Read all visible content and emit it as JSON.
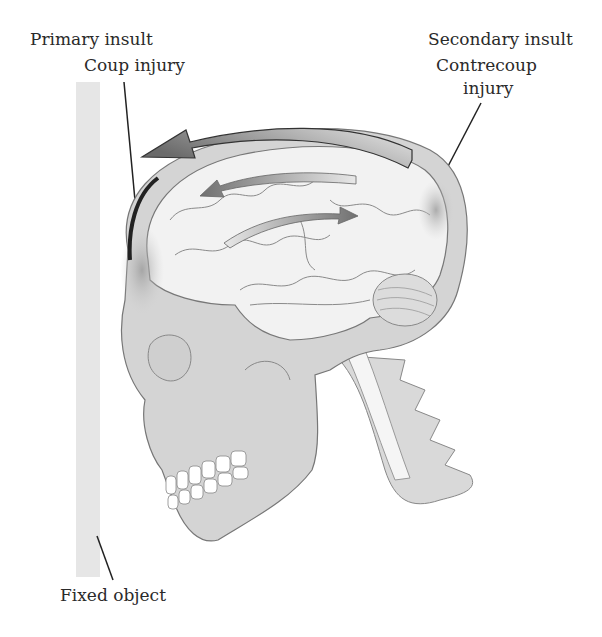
{
  "labels": {
    "primary_insult": "Primary insult",
    "coup_injury": "Coup injury",
    "secondary_insult": "Secondary insult",
    "contrecoup_line1": "Contrecoup",
    "contrecoup_line2": "injury",
    "fixed_object": "Fixed object"
  },
  "colors": {
    "skull": "#d4d4d4",
    "brain": "#f2f2f2",
    "outline": "#6a6a6a",
    "arrow": "#7a7a7a",
    "fixed_object": "#e6e6e6",
    "text": "#2a2a2a"
  }
}
